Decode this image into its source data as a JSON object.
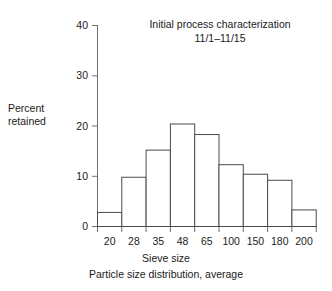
{
  "chart_data": {
    "type": "bar",
    "title": "Initial process characterization",
    "subtitle": "11/1–11/15",
    "ylabel_line1": "Percent",
    "ylabel_line2": "retained",
    "xlabel_line1": "Sieve size",
    "xlabel_line2": "Particle size distribution, average",
    "categories": [
      "20",
      "28",
      "35",
      "48",
      "65",
      "100",
      "150",
      "180",
      "200"
    ],
    "values": [
      2.8,
      9.8,
      15.2,
      20.4,
      18.3,
      12.3,
      10.4,
      9.2,
      3.3
    ],
    "ylim": [
      0,
      40
    ],
    "yticks": [
      "0",
      "10",
      "20",
      "30",
      "40"
    ],
    "ytick_values": [
      0,
      10,
      20,
      30,
      40
    ],
    "grid": false,
    "legend": null,
    "bar_fill": "#ffffff",
    "bar_stroke": "#4a4a4a",
    "axis_color": "#6a6a6a"
  },
  "figure": {
    "background": "#ffffff"
  }
}
